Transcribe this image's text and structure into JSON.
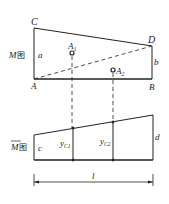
{
  "diagram": {
    "top": {
      "label": "M",
      "label_suffix": "图",
      "points": {
        "C": "C",
        "D": "D",
        "A": "A",
        "B": "B"
      },
      "sides": {
        "a": "a",
        "b": "b"
      },
      "centroids": {
        "A1": "A",
        "A1_sub": "1",
        "A2": "A",
        "A2_sub": "2"
      }
    },
    "bottom": {
      "label": "M",
      "label_suffix": "图",
      "sides": {
        "c": "c",
        "d": "d"
      },
      "ordinates": {
        "yc1": "y",
        "yc1_sub": "C1",
        "yc2": "y",
        "yc2_sub": "C2"
      },
      "length": "l"
    },
    "colors": {
      "line": "#222222",
      "background": "#ffffff"
    }
  }
}
